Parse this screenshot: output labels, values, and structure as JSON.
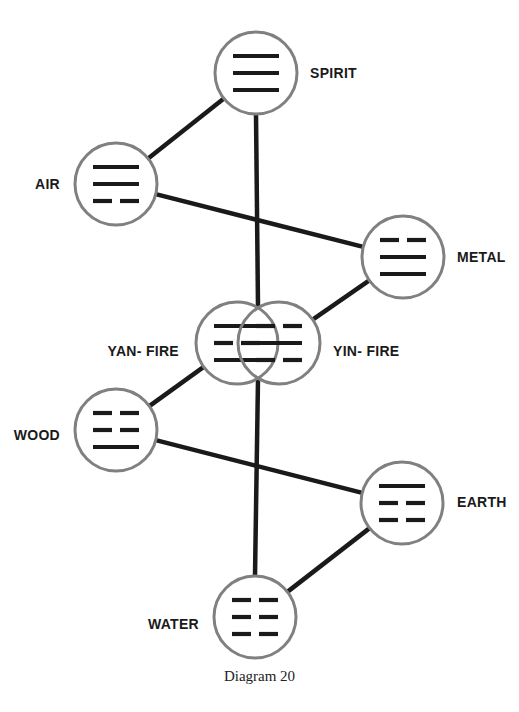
{
  "diagram": {
    "caption": "Diagram 20",
    "colors": {
      "circle_stroke": "#808080",
      "connector": "#1a1a1a",
      "bar": "#1a1a1a",
      "label": "#1a1a1a"
    },
    "nodes": [
      {
        "id": "spirit",
        "label": "SPIRIT",
        "trigram": [
          "solid",
          "solid",
          "solid"
        ]
      },
      {
        "id": "air",
        "label": "AIR",
        "trigram": [
          "solid",
          "solid",
          "broken"
        ]
      },
      {
        "id": "metal",
        "label": "METAL",
        "trigram": [
          "broken",
          "solid",
          "solid"
        ]
      },
      {
        "id": "yang-fire",
        "label": "YAN- FIRE",
        "trigram": [
          "solid",
          "broken",
          "solid"
        ]
      },
      {
        "id": "yin-fire",
        "label": "YIN- FIRE",
        "trigram": [
          "broken",
          "solid",
          "broken"
        ]
      },
      {
        "id": "wood",
        "label": "WOOD",
        "trigram": [
          "broken",
          "broken",
          "solid"
        ]
      },
      {
        "id": "earth",
        "label": "EARTH",
        "trigram": [
          "solid",
          "broken",
          "broken"
        ]
      },
      {
        "id": "water",
        "label": "WATER",
        "trigram": [
          "broken",
          "broken",
          "broken"
        ]
      }
    ],
    "edges": [
      {
        "from": "spirit",
        "to": "air"
      },
      {
        "from": "air",
        "to": "metal"
      },
      {
        "from": "metal",
        "to": "yin-fire"
      },
      {
        "from": "yang-fire",
        "to": "wood"
      },
      {
        "from": "wood",
        "to": "earth"
      },
      {
        "from": "earth",
        "to": "water"
      },
      {
        "from": "spirit",
        "to": "fire-center"
      },
      {
        "from": "fire-center",
        "to": "water"
      }
    ]
  }
}
